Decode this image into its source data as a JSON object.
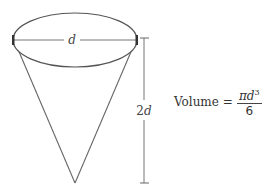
{
  "diagram": {
    "shape": "cone",
    "diameter_label": "d",
    "height_label_coef": "2",
    "height_label_var": "d",
    "stroke_color": "#555555"
  },
  "formula": {
    "lhs": "Volume",
    "equals": "=",
    "numerator_pi": "π",
    "numerator_var": "d",
    "numerator_exp": "3",
    "denominator": "6"
  }
}
